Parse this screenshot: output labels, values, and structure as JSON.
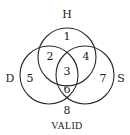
{
  "diagram": {
    "type": "venn-3-set",
    "caption": "VALID",
    "sets": [
      {
        "id": "H",
        "label": "H"
      },
      {
        "id": "D",
        "label": "D"
      },
      {
        "id": "S",
        "label": "S"
      }
    ],
    "regions": [
      {
        "id": "r1",
        "label": "1",
        "members": [
          "H"
        ]
      },
      {
        "id": "r2",
        "label": "2",
        "members": [
          "H",
          "D"
        ]
      },
      {
        "id": "r3",
        "label": "3",
        "members": [
          "H",
          "D",
          "S"
        ]
      },
      {
        "id": "r4",
        "label": "4",
        "members": [
          "H",
          "S"
        ]
      },
      {
        "id": "r5",
        "label": "5",
        "members": [
          "D"
        ]
      },
      {
        "id": "r6",
        "label": "6",
        "members": [
          "D",
          "S"
        ]
      },
      {
        "id": "r7",
        "label": "7",
        "members": [
          "S"
        ]
      },
      {
        "id": "r8",
        "label": "8",
        "members": []
      }
    ],
    "stroke_color": "#2a2a2a",
    "text_color": "#1a1a1a"
  }
}
